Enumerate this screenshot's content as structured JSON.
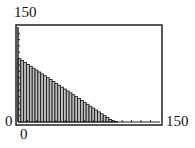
{
  "chart_data": {
    "type": "bar",
    "title": "",
    "xlabel": "",
    "ylabel": "",
    "xlim": [
      0,
      150
    ],
    "ylim": [
      0,
      150
    ],
    "tick_labels": {
      "x_min": "0",
      "x_max": "150",
      "y_min": "0",
      "y_max": "150"
    },
    "grid": false,
    "legend": null,
    "bar_width": 3,
    "x": [
      0,
      3,
      6,
      9,
      12,
      15,
      18,
      21,
      24,
      27,
      30,
      33,
      36,
      39,
      42,
      45,
      48,
      51,
      54,
      57,
      60,
      63,
      66,
      69,
      72,
      75,
      78,
      81,
      84,
      87,
      90,
      93,
      96,
      99,
      102,
      105
    ],
    "values": [
      100,
      97,
      94,
      91,
      88,
      85,
      82,
      79,
      76,
      73,
      70,
      67,
      64,
      61,
      58,
      55,
      52,
      49,
      46,
      43,
      40,
      37,
      34,
      31,
      28,
      25,
      22,
      19,
      16,
      13,
      10,
      7,
      4,
      2,
      1,
      0
    ],
    "colors": {
      "bar_fill": "#bdbdbd",
      "bar_edge": "#111111",
      "frame": "#222222"
    }
  }
}
